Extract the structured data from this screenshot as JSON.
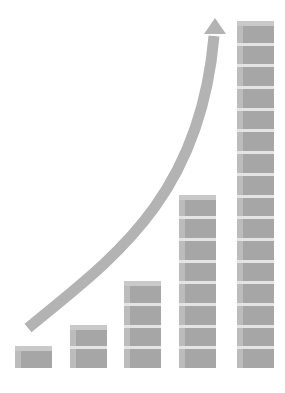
{
  "chart_data": {
    "type": "bar",
    "title": "",
    "xlabel": "",
    "ylabel": "",
    "categories": [
      "1",
      "2",
      "3",
      "4",
      "5"
    ],
    "values": [
      1,
      2,
      4,
      8,
      16
    ],
    "unit": "cubes",
    "annotations": [
      "exponential growth arrow curving upward from lower-left to top-right"
    ],
    "grid": false,
    "legend": null
  },
  "colors": {
    "cube_front": "#a6a6a6",
    "cube_side": "#bcbcbc",
    "cube_top": "#e4e4e4",
    "arrow": "#b3b3b3",
    "background": "#ffffff"
  },
  "columns": [
    {
      "left": 15,
      "cubes": 1
    },
    {
      "left": 70,
      "cubes": 2
    },
    {
      "left": 124,
      "cubes": 4
    },
    {
      "left": 179,
      "cubes": 8
    },
    {
      "left": 237,
      "cubes": 16
    }
  ]
}
